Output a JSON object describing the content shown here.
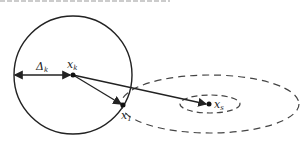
{
  "diagram": {
    "type": "trust-region illustration",
    "labels": {
      "delta": {
        "main": "Δ",
        "sub": "k"
      },
      "xk": {
        "main": "x",
        "sub": "k"
      },
      "x1": {
        "main": "x",
        "sub": "1"
      },
      "xs": {
        "main": "x",
        "sub": "s"
      }
    },
    "colors": {
      "stroke": "#222222",
      "dashed": "#444444"
    }
  }
}
